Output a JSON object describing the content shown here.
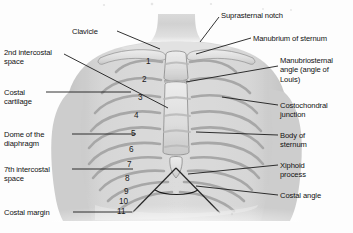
{
  "figure": {
    "type": "anatomical-illustration",
    "region": "chest / thoracic cage",
    "background_color": "#fdfdfd",
    "line_color": "#1b1b1b",
    "text_color": "#111111"
  },
  "labels_left": [
    {
      "id": "second-intercostal-space",
      "text": "2nd intercostal\nspace",
      "x": 4,
      "y": 48
    },
    {
      "id": "costal-cartilage",
      "text": "Costal\ncartilage",
      "x": 4,
      "y": 88
    },
    {
      "id": "dome-of-the-diaphragm",
      "text": "Dome of the\ndiaphragm",
      "x": 4,
      "y": 130
    },
    {
      "id": "seventh-intercostal-space",
      "text": "7th intercostal\nspace",
      "x": 4,
      "y": 165
    },
    {
      "id": "costal-margin",
      "text": "Costal margin",
      "x": 4,
      "y": 208
    }
  ],
  "labels_top": [
    {
      "id": "clavicle",
      "text": "Clavicle",
      "x": 72,
      "y": 27
    },
    {
      "id": "suprasternal-notch",
      "text": "Suprasternal notch",
      "x": 221,
      "y": 11
    }
  ],
  "labels_right": [
    {
      "id": "manubrium-of-sternum",
      "text": "Manubrium of sternum",
      "x": 253,
      "y": 34
    },
    {
      "id": "manubriosternal-angle",
      "text": "Manubriosternal\nangle (angle of\nLouis)",
      "x": 280,
      "y": 56
    },
    {
      "id": "costochondral-junction",
      "text": "Costochondral\njunction",
      "x": 280,
      "y": 101
    },
    {
      "id": "body-of-sternum",
      "text": "Body of\nsternum",
      "x": 280,
      "y": 131
    },
    {
      "id": "xiphoid-process",
      "text": "Xiphoid\nprocess",
      "x": 280,
      "y": 161
    },
    {
      "id": "costal-angle",
      "text": "Costal angle",
      "x": 280,
      "y": 191
    }
  ],
  "rib_numbers": [
    {
      "label": "1",
      "x": 146,
      "y": 58
    },
    {
      "label": "2",
      "x": 142,
      "y": 76
    },
    {
      "label": "3",
      "x": 138,
      "y": 94
    },
    {
      "label": "4",
      "x": 134,
      "y": 112
    },
    {
      "label": "5",
      "x": 131,
      "y": 130
    },
    {
      "label": "6",
      "x": 129,
      "y": 146
    },
    {
      "label": "7",
      "x": 127,
      "y": 161
    },
    {
      "label": "8",
      "x": 125,
      "y": 175
    },
    {
      "label": "9",
      "x": 124,
      "y": 188
    },
    {
      "label": "10",
      "x": 119,
      "y": 198
    },
    {
      "label": "11",
      "x": 117,
      "y": 208
    }
  ],
  "leaders": [
    {
      "id": "leader-clavicle",
      "x1": 117,
      "y1": 31,
      "x2": 160,
      "y2": 49
    },
    {
      "id": "leader-suprasternal-notch",
      "x1": 219,
      "y1": 17,
      "x2": 200,
      "y2": 42
    },
    {
      "id": "leader-second-intercostal",
      "x1": 64,
      "y1": 54,
      "x2": 168,
      "y2": 108
    },
    {
      "id": "leader-costal-cartilage",
      "x1": 46,
      "y1": 92,
      "x2": 131,
      "y2": 92
    },
    {
      "id": "leader-dome-diaphragm",
      "x1": 72,
      "y1": 134,
      "x2": 136,
      "y2": 134
    },
    {
      "id": "leader-seventh-intercostal",
      "x1": 72,
      "y1": 169,
      "x2": 133,
      "y2": 169
    },
    {
      "id": "leader-costal-margin",
      "x1": 73,
      "y1": 212,
      "x2": 132,
      "y2": 212
    },
    {
      "id": "leader-manubrium",
      "x1": 251,
      "y1": 38,
      "x2": 196,
      "y2": 54
    },
    {
      "id": "leader-manubriosternal-angle",
      "x1": 278,
      "y1": 66,
      "x2": 186,
      "y2": 82
    },
    {
      "id": "leader-costochondral-junction",
      "x1": 278,
      "y1": 105,
      "x2": 222,
      "y2": 97
    },
    {
      "id": "leader-body-of-sternum",
      "x1": 278,
      "y1": 135,
      "x2": 196,
      "y2": 132
    },
    {
      "id": "leader-xiphoid-process",
      "x1": 278,
      "y1": 165,
      "x2": 188,
      "y2": 174
    },
    {
      "id": "leader-costal-angle",
      "x1": 278,
      "y1": 195,
      "x2": 196,
      "y2": 186
    }
  ]
}
